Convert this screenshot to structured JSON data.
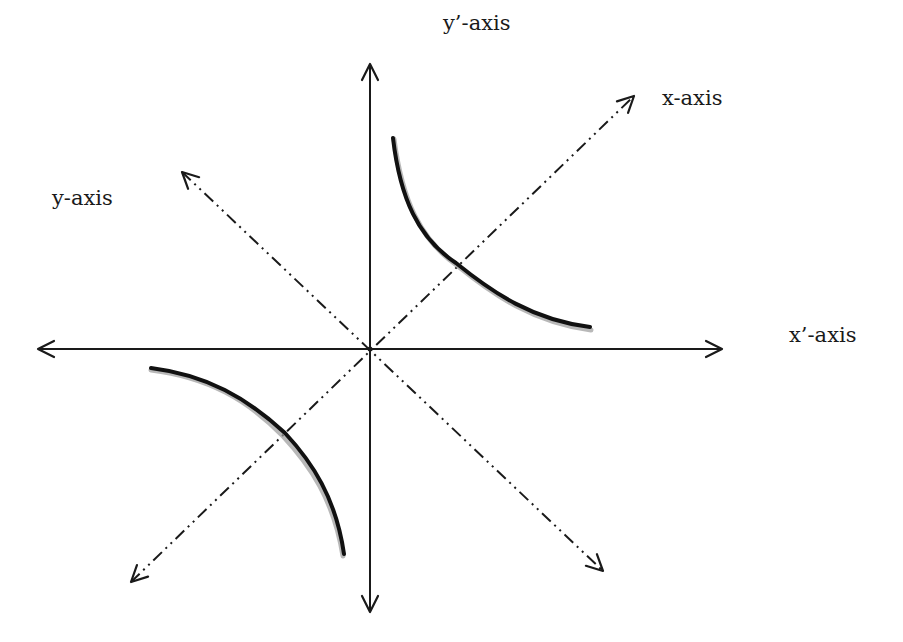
{
  "labels": {
    "y_prime_axis": "y’-axis",
    "x_axis": "x-axis",
    "y_axis": "y-axis",
    "x_prime_axis": "x’-axis"
  },
  "colors": {
    "background": "#ffffff",
    "stroke": "#1a1a1a",
    "curve": "#111111",
    "curve_shadow": "#9a9a9a"
  },
  "geometry": {
    "origin": [
      370,
      349
    ],
    "solid_axes": {
      "vertical": {
        "from": [
          370,
          612
        ],
        "to": [
          370,
          64
        ],
        "double_arrow": true,
        "name": "y'-axis"
      },
      "horizontal": {
        "from": [
          38,
          349
        ],
        "to": [
          722,
          349
        ],
        "double_arrow": true,
        "name": "x'-axis"
      }
    },
    "dash_dot_axes": {
      "diagonal_ne_sw": {
        "from": [
          131,
          582
        ],
        "to": [
          634,
          96
        ],
        "double_arrow": true,
        "name": "x-axis"
      },
      "diagonal_nw_se": {
        "from": [
          182,
          172
        ],
        "to": [
          603,
          571
        ],
        "double_arrow": true,
        "name": "y-axis"
      }
    },
    "hyperbola_branches": [
      {
        "quadrant": "upper-right",
        "points": [
          [
            393,
            138
          ],
          [
            456,
            263
          ],
          [
            590,
            328
          ]
        ]
      },
      {
        "quadrant": "lower-left",
        "points": [
          [
            151,
            368
          ],
          [
            285,
            433
          ],
          [
            344,
            554
          ]
        ]
      }
    ]
  }
}
